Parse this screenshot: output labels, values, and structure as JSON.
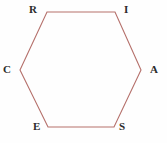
{
  "figure": {
    "name": "hexagon-diagram",
    "shape_type": "hexagon",
    "width": 167,
    "height": 143,
    "background_color": "#fefefe",
    "stroke_color": "#b5706b",
    "stroke_width": 1,
    "fill_color": "none",
    "label_color": "#2b2b2b",
    "vertices": [
      {
        "id": "R",
        "label": "R",
        "x": 47,
        "y": 12,
        "position": "top-left"
      },
      {
        "id": "I",
        "label": "I",
        "x": 115,
        "y": 12,
        "position": "top-right"
      },
      {
        "id": "A",
        "label": "A",
        "x": 141,
        "y": 70,
        "position": "right"
      },
      {
        "id": "S",
        "label": "S",
        "x": 114,
        "y": 127,
        "position": "bottom-right"
      },
      {
        "id": "E",
        "label": "E",
        "x": 48,
        "y": 127,
        "position": "bottom-left"
      },
      {
        "id": "C",
        "label": "C",
        "x": 20,
        "y": 70,
        "position": "left"
      }
    ],
    "edges": [
      {
        "from": "R",
        "to": "I",
        "orientation": "horizontal"
      },
      {
        "from": "I",
        "to": "A",
        "orientation": "diagonal"
      },
      {
        "from": "A",
        "to": "S",
        "orientation": "diagonal"
      },
      {
        "from": "S",
        "to": "E",
        "orientation": "horizontal"
      },
      {
        "from": "E",
        "to": "C",
        "orientation": "diagonal"
      },
      {
        "from": "C",
        "to": "R",
        "orientation": "diagonal"
      }
    ]
  }
}
